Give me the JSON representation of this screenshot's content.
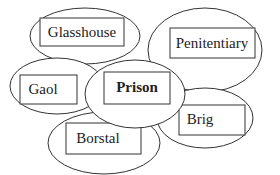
{
  "diagram": {
    "title": "",
    "nodes": [
      {
        "id": "glasshouse",
        "label": "Glasshouse",
        "bold": false
      },
      {
        "id": "penitentiary",
        "label": "Penitentiary",
        "bold": false
      },
      {
        "id": "gaol",
        "label": "Gaol",
        "bold": false
      },
      {
        "id": "prison",
        "label": "Prison",
        "bold": true
      },
      {
        "id": "brig",
        "label": "Brig",
        "bold": false
      },
      {
        "id": "borstal",
        "label": "Borstal",
        "bold": false
      }
    ],
    "center": "prison",
    "colors": {
      "stroke": "#333333",
      "fill": "#ffffff",
      "text": "#222222"
    }
  }
}
